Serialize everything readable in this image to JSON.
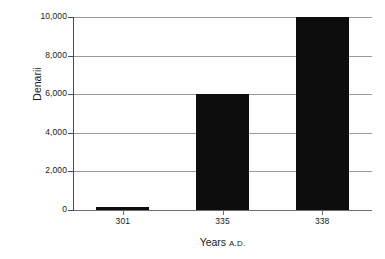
{
  "chart_data": {
    "type": "bar",
    "title": "",
    "subtitle": "",
    "xlabel": "Years",
    "xlabel_suffix": "A.D.",
    "ylabel": "Denarii",
    "categories": [
      "301",
      "335",
      "338"
    ],
    "values": [
      150,
      6000,
      10000
    ],
    "ylim": [
      0,
      10000
    ],
    "y_ticks": [
      0,
      2000,
      4000,
      6000,
      8000,
      10000
    ],
    "y_tick_labels": [
      "0",
      "2,000",
      "4,000",
      "6,000",
      "8,000",
      "10,000"
    ],
    "grid": true,
    "legend": null,
    "series": [
      {
        "name": "Denarii",
        "values": [
          150,
          6000,
          10000
        ],
        "color": "#0d0d0d"
      }
    ],
    "annotations": []
  },
  "style": {
    "bar_color": "#0d0d0d",
    "grid_color": "#9a9a9a",
    "axis_color": "#4a4a4a",
    "text_color": "#1a1a1a",
    "background": "#fefefe"
  }
}
